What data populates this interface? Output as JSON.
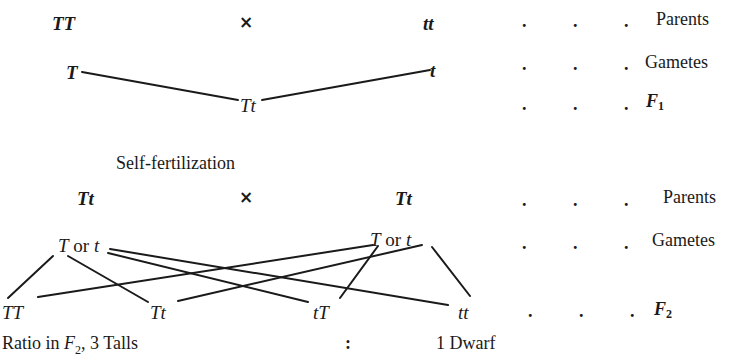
{
  "cross1": {
    "parent_left": "TT",
    "cross_symbol": "×",
    "parent_right": "tt",
    "gamete_left": "T",
    "gamete_right": "t",
    "f1": "Tt"
  },
  "section_label": "Self-fertilization",
  "cross2": {
    "parent_left": "Tt",
    "cross_symbol": "×",
    "parent_right": "Tt",
    "gamete_left": {
      "a": "T",
      "or": "or",
      "b": "t"
    },
    "gamete_right": {
      "a": "T",
      "or": "or",
      "b": "t"
    },
    "f2": [
      "TT",
      "Tt",
      "tT",
      "tt"
    ]
  },
  "row_labels": {
    "dots": ".",
    "parents": "Parents",
    "gametes": "Gametes",
    "f1": {
      "letter": "F",
      "sub": "1"
    },
    "parents2": "Parents",
    "gametes2": "Gametes",
    "f2": {
      "letter": "F",
      "sub": "2"
    }
  },
  "ratio": {
    "prefix": "Ratio in ",
    "gen_letter": "F",
    "gen_sub": "2",
    "talls": ", 3 Talls",
    "colon": ":",
    "dwarf": "1 Dwarf"
  }
}
